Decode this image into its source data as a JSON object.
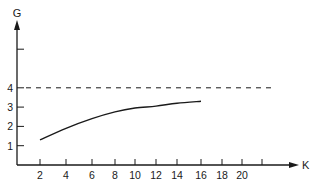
{
  "chart_data": {
    "type": "line",
    "title": "",
    "xlabel": "K",
    "ylabel": "G",
    "x_ticks": [
      2,
      4,
      6,
      8,
      10,
      12,
      14,
      16,
      18,
      20,
      22
    ],
    "x_tick_labels": [
      "2",
      "4",
      "6",
      "8",
      "10",
      "12",
      "14",
      "16",
      "18",
      "20",
      ""
    ],
    "y_ticks": [
      1,
      2,
      3,
      4,
      6
    ],
    "y_tick_labels": [
      "1",
      "2",
      "3",
      "4",
      ""
    ],
    "xlim": [
      0,
      24
    ],
    "ylim": [
      0,
      7.5
    ],
    "grid": false,
    "legend": null,
    "series": [
      {
        "name": "G(K)",
        "style": "solid",
        "x": [
          2,
          4,
          6,
          8,
          10,
          12,
          14,
          16
        ],
        "y": [
          1.3,
          1.9,
          2.4,
          2.75,
          2.95,
          3.05,
          3.2,
          3.3
        ]
      }
    ],
    "reference_lines": [
      {
        "name": "asymptote",
        "orientation": "horizontal",
        "y": 4,
        "style": "dashed",
        "x_range": [
          0,
          22.5
        ]
      }
    ]
  },
  "colors": {
    "ink": "#1a1a1a",
    "background": "#ffffff"
  }
}
